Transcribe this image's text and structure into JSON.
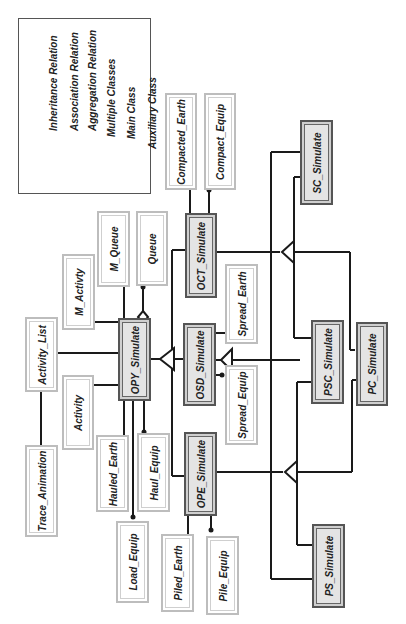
{
  "legend": {
    "items": [
      {
        "symbol": "inheritance-relation",
        "label": "Inheritance Relation"
      },
      {
        "symbol": "association-relation",
        "label": "Association Relation"
      },
      {
        "symbol": "aggregation-relation",
        "label": "Aggregation Relation"
      },
      {
        "symbol": "multiple-classes",
        "label": "Multiple Classes"
      },
      {
        "symbol": "main-class",
        "label": "Main Class"
      },
      {
        "symbol": "auxiliary-class",
        "label": "Auxiliary Class"
      }
    ]
  },
  "classes": {
    "compacted_earth": "Compacted_Earth",
    "compact_equip": "Compact_Equip",
    "sc_simulate": "SC_Simulate",
    "m_queue": "M_Queue",
    "queue": "Queue",
    "m_activty": "M_Activty",
    "oct_simulate": "OCT_Simulate",
    "spread_earth": "Spread_Earth",
    "activity_list": "Activity_List",
    "opy_simulate": "OPY_Simulate",
    "osd_simulate": "OSD_Simulate",
    "psc_simulate": "PSC_Simulate",
    "pc_simulate": "PC_Simulate",
    "activity": "Activity",
    "spread_equip": "Spread_Equip",
    "trace_animation": "Trace_Animation",
    "hauled_earth": "Hauled_Earth",
    "haul_equip": "Haul_Equip",
    "ope_simulate": "OPE_Simulate",
    "load_equip": "Load_Equip",
    "piled_earth": "Piled_Earth",
    "pile_equip": "Pile_Equip",
    "ps_simulate": "PS_Simulate"
  },
  "colors": {
    "line": "#1a1a1a",
    "main_fill": "#e4e4e4",
    "main_border": "#555555",
    "aux_border": "#bdbdbd"
  }
}
